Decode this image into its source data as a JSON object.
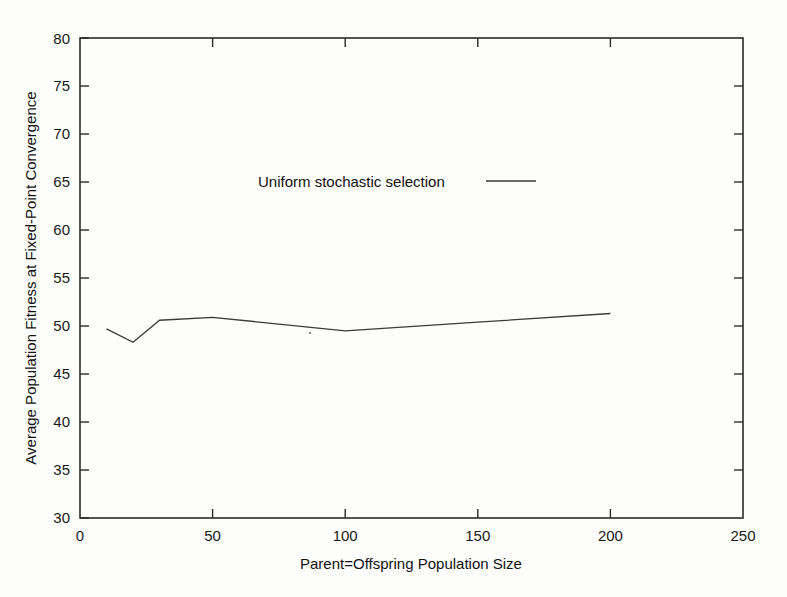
{
  "chart_data": {
    "type": "line",
    "title": "",
    "xlabel": "Parent=Offspring Population Size",
    "ylabel": "Average Population Fitness at Fixed-Point Convergence",
    "xlim": [
      0,
      250
    ],
    "ylim": [
      30,
      80
    ],
    "xticks": [
      0,
      50,
      100,
      150,
      200,
      250
    ],
    "yticks": [
      30,
      35,
      40,
      45,
      50,
      55,
      60,
      65,
      70,
      75,
      80
    ],
    "xtick_labels": [
      "0",
      "50",
      "100",
      "150",
      "200",
      "250"
    ],
    "ytick_labels": [
      "30",
      "35",
      "40",
      "45",
      "50",
      "55",
      "60",
      "65",
      "70",
      "75",
      "80"
    ],
    "grid": false,
    "legend_position": "upper-center-inside",
    "series": [
      {
        "name": "Uniform stochastic selection",
        "x": [
          10,
          20,
          30,
          50,
          100,
          150,
          200
        ],
        "values": [
          49.7,
          48.3,
          50.6,
          50.9,
          49.5,
          50.4,
          51.3
        ]
      }
    ]
  },
  "legend": {
    "entries": [
      {
        "label": "Uniform stochastic selection"
      }
    ]
  },
  "axes": {
    "x_title": "Parent=Offspring Population Size",
    "y_title": "Average Population Fitness at Fixed-Point Convergence",
    "x_labels": [
      "0",
      "50",
      "100",
      "150",
      "200",
      "250"
    ],
    "y_labels": [
      "30",
      "35",
      "40",
      "45",
      "50",
      "55",
      "60",
      "65",
      "70",
      "75",
      "80"
    ]
  },
  "colors": {
    "background": "#fdfdfb",
    "axis": "#2b2b2b",
    "series": "#3a3a3a",
    "text": "#111111"
  }
}
